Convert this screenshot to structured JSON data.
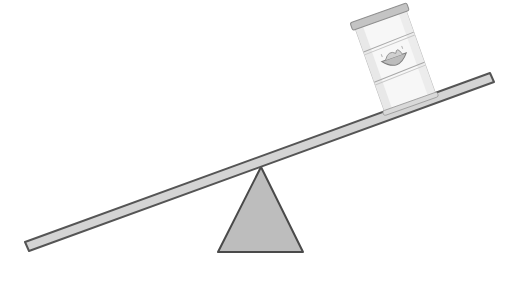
{
  "scene": {
    "description": "Seesaw tilted with a food can resting on the raised right end",
    "colors": {
      "background": "#ffffff",
      "beam_fill": "#d4d4d4",
      "beam_stroke": "#555555",
      "fulcrum_fill": "#bdbdbd",
      "fulcrum_stroke": "#4a4a4a",
      "can_body": "#f7f7f7",
      "can_shade": "#e2e2e2",
      "can_lid": "#a8a8a8",
      "can_lines": "#9a9a9a",
      "bowl": "#8c8c8c"
    },
    "objects": [
      {
        "name": "seesaw-beam",
        "icon": "plank"
      },
      {
        "name": "fulcrum",
        "icon": "triangle"
      },
      {
        "name": "food-can",
        "icon": "can-with-bowl-label"
      }
    ]
  }
}
